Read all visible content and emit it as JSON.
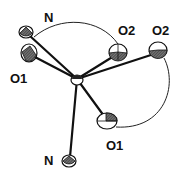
{
  "diagram": {
    "type": "ORTEP molecular structure",
    "center_atom": {
      "x": 77,
      "y": 79
    },
    "atoms": [
      {
        "id": "N_top",
        "label": "N",
        "x": 26,
        "y": 32,
        "lx": 46,
        "ly": 22
      },
      {
        "id": "O1_left",
        "label": "O1",
        "x": 29,
        "y": 53,
        "lx": 12,
        "ly": 83
      },
      {
        "id": "O2_mid",
        "label": "O2",
        "x": 118,
        "y": 52,
        "lx": 120,
        "ly": 34
      },
      {
        "id": "O2_right",
        "label": "O2",
        "x": 158,
        "y": 50,
        "lx": 155,
        "ly": 34
      },
      {
        "id": "O1_bottom",
        "label": "O1",
        "x": 107,
        "y": 121,
        "lx": 107,
        "ly": 149
      },
      {
        "id": "N_bottom",
        "label": "N",
        "x": 69,
        "y": 161,
        "lx": 45,
        "ly": 163
      }
    ],
    "labels": {
      "N_top": "N",
      "O1_left": "O1",
      "O2_mid": "O2",
      "O2_right": "O2",
      "O1_bottom": "O1",
      "N_bottom": "N"
    }
  }
}
